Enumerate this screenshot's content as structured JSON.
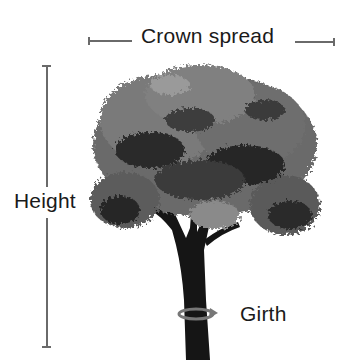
{
  "diagram": {
    "labels": {
      "crown_spread": "Crown spread",
      "height": "Height",
      "girth": "Girth"
    },
    "colors": {
      "text": "#1a1a1a",
      "lines": "#6a6a6a",
      "foliage_dark": "#1e1e1e",
      "foliage_mid": "#5a5a5a",
      "foliage_light": "#8c8c8c",
      "trunk": "#151515",
      "girth_arrow": "#777777"
    }
  }
}
